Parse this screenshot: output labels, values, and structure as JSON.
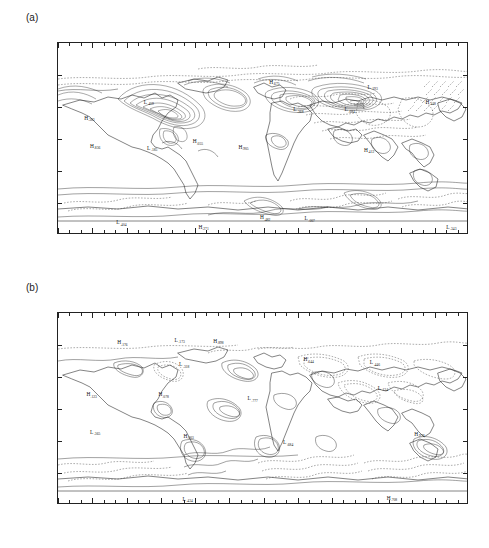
{
  "figure": {
    "panels": [
      {
        "tag": "(a)",
        "id": "panel-a",
        "y_axis": {
          "labels": [
            "N 90°",
            "60°",
            "30°",
            "0°",
            "30°",
            "60°",
            "S 90°"
          ],
          "values": [
            90,
            60,
            30,
            0,
            -30,
            -60,
            -90
          ]
        },
        "x_axis": {
          "labels": [
            "180°",
            "150°",
            "120°",
            "90°",
            "60°",
            "30°",
            "0°",
            "30°",
            "60°",
            "90°",
            "120°",
            "150°",
            "180°"
          ],
          "values": [
            -180,
            -150,
            -120,
            -90,
            -60,
            -30,
            0,
            30,
            60,
            90,
            120,
            150,
            180
          ],
          "left_hemisphere": "W",
          "right_hemisphere": "E"
        },
        "extrema": [
          {
            "type": "L",
            "value": ".459",
            "lon": -105,
            "lat": 33
          },
          {
            "type": "H",
            "value": ".383",
            "lon": -157,
            "lat": 18
          },
          {
            "type": "H",
            "value": ".836",
            "lon": -152,
            "lat": -8
          },
          {
            "type": "L",
            "value": ".185",
            "lon": -102,
            "lat": -10
          },
          {
            "type": "H",
            "value": ".055",
            "lon": -62,
            "lat": -4
          },
          {
            "type": "H",
            "value": ".675",
            "lon": 5,
            "lat": 52
          },
          {
            "type": "H",
            "value": ".905",
            "lon": -22,
            "lat": -9
          },
          {
            "type": "L",
            "value": ".368",
            "lon": 26,
            "lat": 26
          },
          {
            "type": "L",
            "value": ".684",
            "lon": 71,
            "lat": 26
          },
          {
            "type": "L",
            "value": ".193",
            "lon": 91,
            "lat": 47
          },
          {
            "type": "H",
            "value": ".412",
            "lon": 88,
            "lat": -12
          },
          {
            "type": "H",
            "value": ".448",
            "lon": 142,
            "lat": 33
          },
          {
            "type": "L",
            "value": ".404",
            "lon": -129,
            "lat": -80
          },
          {
            "type": "H",
            "value": ".271",
            "lon": -57,
            "lat": -84
          },
          {
            "type": "H",
            "value": ".482",
            "lon": -3,
            "lat": -75
          },
          {
            "type": "L",
            "value": ".007",
            "lon": 36,
            "lat": -76
          },
          {
            "type": "L",
            "value": ".343",
            "lon": 160,
            "lat": -84
          }
        ]
      },
      {
        "tag": "(b)",
        "id": "panel-b",
        "y_axis": {
          "labels": [
            "N 90°",
            "60°",
            "30°",
            "0°",
            "30°",
            "60°",
            "S 90°"
          ],
          "values": [
            90,
            60,
            30,
            0,
            -30,
            -60,
            -90
          ]
        },
        "x_axis": {
          "labels": [
            "180°",
            "150°",
            "120°",
            "90°",
            "60°",
            "30°",
            "0°",
            "30°",
            "60°",
            "90°",
            "120°",
            "150°",
            "180°"
          ],
          "values": [
            -180,
            -150,
            -120,
            -90,
            -60,
            -30,
            0,
            30,
            60,
            90,
            120,
            150,
            180
          ],
          "left_hemisphere": "W",
          "right_hemisphere": "E"
        },
        "extrema": [
          {
            "type": "H",
            "value": ".176",
            "lon": -128,
            "lat": 61
          },
          {
            "type": "L",
            "value": ".173",
            "lon": -78,
            "lat": 63
          },
          {
            "type": "H",
            "value": ".898",
            "lon": -44,
            "lat": 62
          },
          {
            "type": "L",
            "value": ".318",
            "lon": -74,
            "lat": 40
          },
          {
            "type": "H",
            "value": ".123",
            "lon": -155,
            "lat": 12
          },
          {
            "type": "H",
            "value": ".078",
            "lon": -92,
            "lat": 12
          },
          {
            "type": "L",
            "value": ".365",
            "lon": -152,
            "lat": -23
          },
          {
            "type": "H",
            "value": ".003",
            "lon": -70,
            "lat": -27
          },
          {
            "type": "L",
            "value": ".777",
            "lon": -14,
            "lat": 8
          },
          {
            "type": "L",
            "value": ".684",
            "lon": 17,
            "lat": -33
          },
          {
            "type": "H",
            "value": ".644",
            "lon": 35,
            "lat": 45
          },
          {
            "type": "L",
            "value": ".446",
            "lon": 93,
            "lat": 42
          },
          {
            "type": "L",
            "value": ".134",
            "lon": 100,
            "lat": 18
          },
          {
            "type": "H",
            "value": ".978",
            "lon": 132,
            "lat": -25
          },
          {
            "type": "L",
            "value": ".434",
            "lon": -71,
            "lat": -86
          },
          {
            "type": "H",
            "value": ".708",
            "lon": 108,
            "lat": -85
          }
        ]
      }
    ]
  },
  "chart_data": {
    "type": "contour_map",
    "title": "",
    "projection": "cylindrical equidistant",
    "xlabel": "",
    "ylabel": "",
    "xlim": [
      -180,
      180
    ],
    "ylim": [
      -90,
      90
    ],
    "grid": false,
    "legend": "none",
    "xticks": [
      -180,
      -150,
      -120,
      -90,
      -60,
      -30,
      0,
      30,
      60,
      90,
      120,
      150,
      180
    ],
    "yticks": [
      90,
      60,
      30,
      0,
      -30,
      -60,
      -90
    ],
    "contour_styles": [
      {
        "name": "positive",
        "style": "solid"
      },
      {
        "name": "negative",
        "style": "dashed"
      }
    ],
    "panels": [
      {
        "label": "(a)",
        "description": "Global contour field with dense nested contours over high northern latitudes (North America, Greenland, northern Eurasia) and banded contours over the Southern Ocean.",
        "extrema_count": 17,
        "max_labeled": ".905",
        "min_labeled": ".007"
      },
      {
        "label": "(b)",
        "description": "Global contour field with weaker, more scattered centres; dashed negative contours dominate midlatitude Eurasia and the Southern Ocean.",
        "extrema_count": 16,
        "max_labeled": ".978",
        "min_labeled": ".003"
      }
    ]
  }
}
